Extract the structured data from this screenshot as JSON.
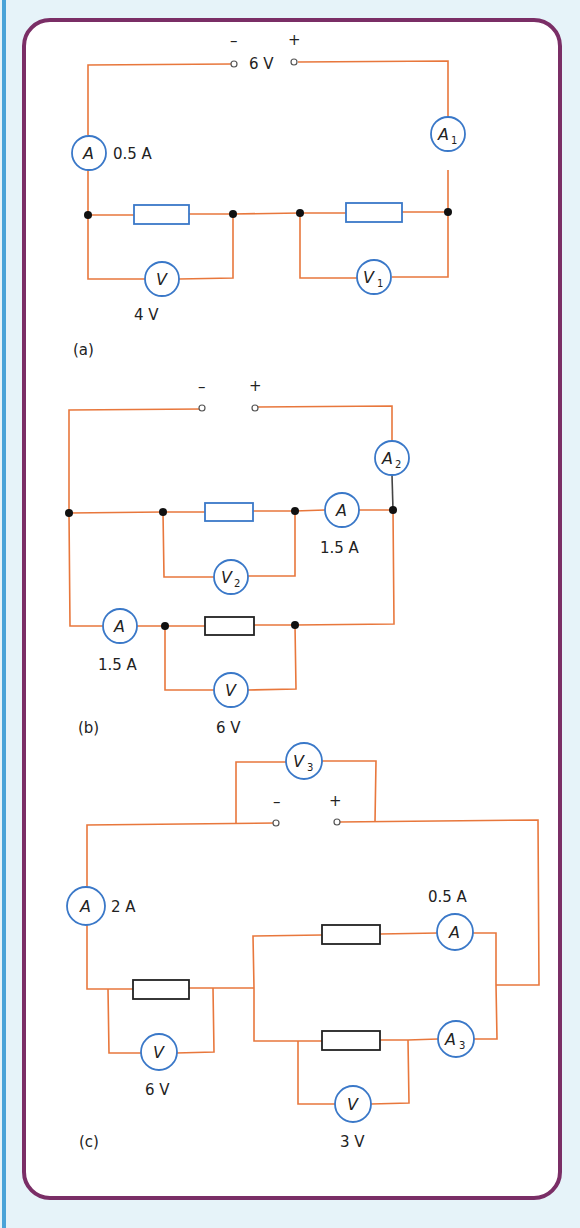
{
  "colors": {
    "background": "#e6f3f9",
    "panel_border": "#7a2e66",
    "left_rule": "#4aa3d8",
    "wire": "#e8773c",
    "meter_outline": "#3a78c8",
    "resistor_blue": "#3a78c8",
    "resistor_black": "#222222"
  },
  "circuit_a": {
    "caption": "(a)",
    "supply": {
      "minus": "–",
      "plus": "+",
      "voltage": "6 V"
    },
    "meters": {
      "ammeter_main": {
        "symbol": "A",
        "sub": "",
        "reading": "0.5 A"
      },
      "ammeter_1": {
        "symbol": "A",
        "sub": "1"
      },
      "voltmeter_main": {
        "symbol": "V",
        "sub": "",
        "reading": "4 V"
      },
      "voltmeter_1": {
        "symbol": "V",
        "sub": "1"
      }
    }
  },
  "circuit_b": {
    "caption": "(b)",
    "supply": {
      "minus": "–",
      "plus": "+"
    },
    "meters": {
      "ammeter_2": {
        "symbol": "A",
        "sub": "2"
      },
      "ammeter_upper": {
        "symbol": "A",
        "sub": "",
        "reading": "1.5 A"
      },
      "voltmeter_2": {
        "symbol": "V",
        "sub": "2"
      },
      "ammeter_lower": {
        "symbol": "A",
        "sub": "",
        "reading": "1.5 A"
      },
      "voltmeter_lower": {
        "symbol": "V",
        "sub": "",
        "reading": "6 V"
      }
    }
  },
  "circuit_c": {
    "caption": "(c)",
    "supply": {
      "minus": "–",
      "plus": "+"
    },
    "meters": {
      "voltmeter_3": {
        "symbol": "V",
        "sub": "3"
      },
      "ammeter_main": {
        "symbol": "A",
        "sub": "",
        "reading": "2 A"
      },
      "ammeter_upper": {
        "symbol": "A",
        "sub": "",
        "reading": "0.5 A"
      },
      "ammeter_3": {
        "symbol": "A",
        "sub": "3"
      },
      "voltmeter_left": {
        "symbol": "V",
        "sub": "",
        "reading": "6 V"
      },
      "voltmeter_lower": {
        "symbol": "V",
        "sub": "",
        "reading": "3 V"
      }
    }
  }
}
